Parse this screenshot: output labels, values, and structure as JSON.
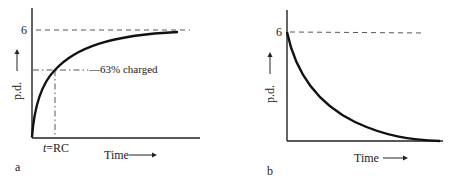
{
  "panel_a": {
    "label": "a",
    "y_tick": "6",
    "y_axis_label": "p.d.",
    "x_axis_label": "Time",
    "annotation": "63% charged",
    "x_marker": "t = RC",
    "x_marker_italic": "t",
    "x_marker_rest": "=RC",
    "curve": "charging"
  },
  "panel_b": {
    "label": "b",
    "y_tick": "6",
    "y_axis_label": "p.d.",
    "x_axis_label": "Time",
    "curve": "discharging"
  },
  "arrow_glyph": "→"
}
